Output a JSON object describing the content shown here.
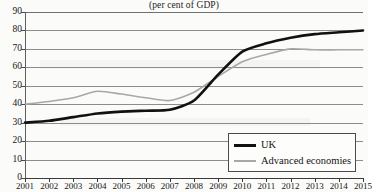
{
  "chart_data": {
    "type": "line",
    "title": "(per cent of GDP)",
    "xlabel": "",
    "ylabel": "",
    "ylim": [
      0,
      90
    ],
    "ytick_step": 10,
    "grid": true,
    "legend_position": "bottom-right",
    "categories": [
      "2001",
      "2002",
      "2003",
      "2004",
      "2005",
      "2006",
      "2007",
      "2008",
      "2009",
      "2010",
      "2011",
      "2012",
      "2013",
      "2014",
      "2015"
    ],
    "yticks": [
      "0",
      "10",
      "20",
      "30",
      "40",
      "50",
      "60",
      "70",
      "80",
      "90"
    ],
    "series": [
      {
        "name": "UK",
        "color": "#111111",
        "width": 2.6,
        "values": [
          30,
          31,
          33,
          35,
          36,
          36.5,
          37,
          42,
          56,
          68.5,
          73,
          76,
          78,
          79,
          80
        ]
      },
      {
        "name": "Advanced economies",
        "color": "#a8a8a8",
        "width": 1.6,
        "values": [
          40,
          41.5,
          43.5,
          47,
          45.5,
          43.5,
          42,
          46.5,
          55,
          63,
          67,
          70,
          69.5,
          69.5,
          69.5
        ]
      }
    ]
  },
  "legend": {
    "items": [
      {
        "label": "UK",
        "swatch": "uk"
      },
      {
        "label": "Advanced economies",
        "swatch": "adv"
      }
    ]
  }
}
